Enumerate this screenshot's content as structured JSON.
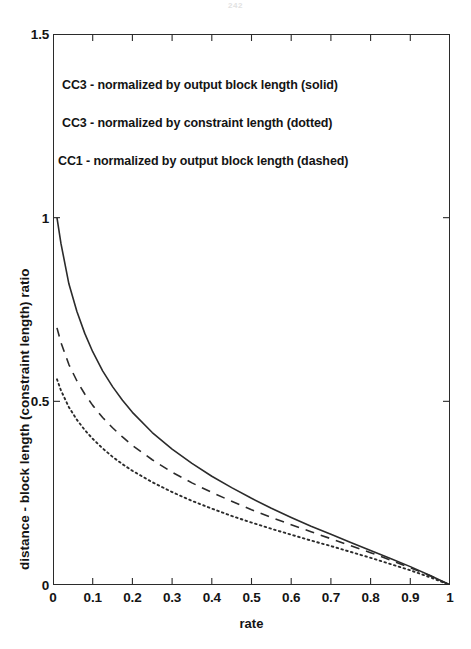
{
  "figure": {
    "page_artifact": "242",
    "background_color": "#ffffff",
    "line_color": "#2b2b2b"
  },
  "chart_data": {
    "type": "line",
    "title": "",
    "xlabel": "rate",
    "ylabel": "distance - block length (constraint length) ratio",
    "xlim": [
      0,
      1
    ],
    "ylim": [
      0,
      1.5
    ],
    "xticks": [
      "0",
      "0.1",
      "0.2",
      "0.3",
      "0.4",
      "0.5",
      "0.6",
      "0.7",
      "0.8",
      "0.9",
      "1"
    ],
    "xtick_values": [
      0,
      0.1,
      0.2,
      0.3,
      0.4,
      0.5,
      0.6,
      0.7,
      0.8,
      0.9,
      1
    ],
    "yticks": [
      "0",
      "0.5",
      "1",
      "1.5"
    ],
    "ytick_values": [
      0,
      0.5,
      1,
      1.5
    ],
    "grid": false,
    "legend_position": "inside-upper-left",
    "annotations": [
      "CC3 - normalized by output block length (solid)",
      "CC3 - normalized by constraint length (dotted)",
      "CC1 - normalized by output block length (dashed)"
    ],
    "x": [
      0.01,
      0.02,
      0.04,
      0.06,
      0.08,
      0.1,
      0.125,
      0.15,
      0.175,
      0.2,
      0.25,
      0.3,
      0.35,
      0.4,
      0.45,
      0.5,
      0.55,
      0.6,
      0.65,
      0.7,
      0.75,
      0.8,
      0.85,
      0.9,
      0.95,
      1.0
    ],
    "series": [
      {
        "name": "CC3 - normalized by output block length",
        "style": "solid",
        "values": [
          1.0,
          0.93,
          0.82,
          0.745,
          0.685,
          0.635,
          0.583,
          0.54,
          0.503,
          0.47,
          0.415,
          0.37,
          0.331,
          0.296,
          0.265,
          0.236,
          0.209,
          0.184,
          0.16,
          0.138,
          0.116,
          0.094,
          0.072,
          0.05,
          0.026,
          0.0
        ]
      },
      {
        "name": "CC1 - normalized by output block length",
        "style": "dashed",
        "values": [
          0.7,
          0.66,
          0.6,
          0.556,
          0.52,
          0.489,
          0.456,
          0.428,
          0.403,
          0.38,
          0.341,
          0.307,
          0.278,
          0.252,
          0.228,
          0.205,
          0.184,
          0.164,
          0.145,
          0.126,
          0.107,
          0.088,
          0.068,
          0.047,
          0.025,
          0.0
        ]
      },
      {
        "name": "CC3 - normalized by constraint length",
        "style": "dotted",
        "values": [
          0.56,
          0.53,
          0.484,
          0.45,
          0.422,
          0.398,
          0.372,
          0.349,
          0.329,
          0.311,
          0.28,
          0.253,
          0.229,
          0.208,
          0.188,
          0.17,
          0.153,
          0.137,
          0.121,
          0.106,
          0.09,
          0.074,
          0.057,
          0.04,
          0.021,
          0.0
        ]
      }
    ]
  }
}
